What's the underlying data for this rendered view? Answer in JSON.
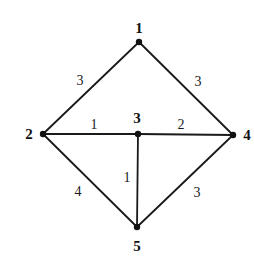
{
  "diagram": {
    "type": "weighted-undirected-graph",
    "colors": {
      "edge": "#1a1a1a",
      "node": "#111111",
      "background": "#ffffff"
    },
    "nodes": [
      {
        "id": "1",
        "label": "1",
        "x": 139,
        "y": 42,
        "label_x": 139,
        "label_y": 28
      },
      {
        "id": "2",
        "label": "2",
        "x": 43,
        "y": 134,
        "label_x": 29,
        "label_y": 134
      },
      {
        "id": "3",
        "label": "3",
        "x": 138,
        "y": 134,
        "label_x": 137,
        "label_y": 118
      },
      {
        "id": "4",
        "label": "4",
        "x": 233,
        "y": 135,
        "label_x": 247,
        "label_y": 135
      },
      {
        "id": "5",
        "label": "5",
        "x": 137,
        "y": 227,
        "label_x": 137,
        "label_y": 246
      }
    ],
    "edges": [
      {
        "from": "1",
        "to": "2",
        "weight": "3",
        "label_x": 80,
        "label_y": 80
      },
      {
        "from": "1",
        "to": "4",
        "weight": "3",
        "label_x": 198,
        "label_y": 81
      },
      {
        "from": "2",
        "to": "3",
        "weight": "1",
        "label_x": 94,
        "label_y": 124
      },
      {
        "from": "3",
        "to": "4",
        "weight": "2",
        "label_x": 181,
        "label_y": 124
      },
      {
        "from": "3",
        "to": "5",
        "weight": "1",
        "label_x": 127,
        "label_y": 177
      },
      {
        "from": "2",
        "to": "5",
        "weight": "4",
        "label_x": 78,
        "label_y": 191
      },
      {
        "from": "4",
        "to": "5",
        "weight": "3",
        "label_x": 197,
        "label_y": 192
      }
    ]
  }
}
